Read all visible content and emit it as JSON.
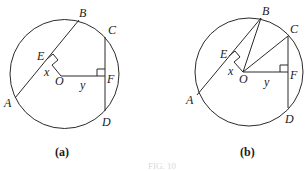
{
  "figures": [
    {
      "id": "a",
      "caption": "(a)",
      "circle": {
        "cx": 64.5,
        "cy": 74,
        "r": 54.5
      },
      "points": {
        "A": {
          "x": 15,
          "y": 98,
          "label": "A"
        },
        "B": {
          "x": 79,
          "y": 20,
          "label": "B"
        },
        "C": {
          "x": 105,
          "y": 37,
          "label": "C"
        },
        "D": {
          "x": 105,
          "y": 111,
          "label": "D"
        },
        "E": {
          "x": 52,
          "y": 58,
          "label": "E"
        },
        "F": {
          "x": 105,
          "y": 76,
          "label": "F"
        },
        "O": {
          "x": 61,
          "y": 76,
          "label": "O"
        }
      },
      "segment_labels": {
        "x": "x",
        "y": "y"
      }
    },
    {
      "id": "b",
      "caption": "(b)",
      "circle": {
        "cx": 249,
        "cy": 72,
        "r": 54
      },
      "points": {
        "A": {
          "x": 197,
          "y": 95,
          "label": "A"
        },
        "B": {
          "x": 261,
          "y": 18,
          "label": "B"
        },
        "C": {
          "x": 288,
          "y": 36,
          "label": "C"
        },
        "D": {
          "x": 288,
          "y": 108,
          "label": "D"
        },
        "E": {
          "x": 238,
          "y": 58,
          "label": "E"
        },
        "F": {
          "x": 288,
          "y": 72,
          "label": "F"
        },
        "O": {
          "x": 243,
          "y": 72,
          "label": "O"
        }
      },
      "segment_labels": {
        "x": "x",
        "y": "y"
      }
    }
  ],
  "footer_text": "FIG. 10"
}
